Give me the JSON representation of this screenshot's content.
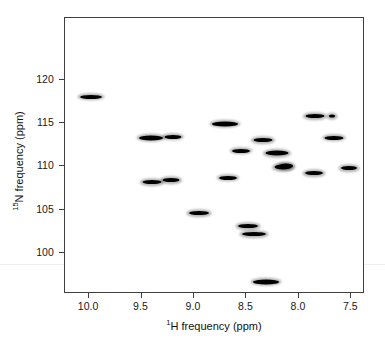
{
  "figure": {
    "kind": "nmr-2d-spectrum",
    "background_color": "#ffffff",
    "frame_color": "#3f3f3f",
    "peak_color": "#000000"
  },
  "axes": {
    "x": {
      "title_prefix": "1",
      "title": "H frequency (ppm)",
      "title_full": "¹H frequency (ppm)",
      "ticks": [
        "10.0",
        "9.5",
        "9.0",
        "8.5",
        "8.0",
        "7.5"
      ],
      "tick_values": [
        10.0,
        9.5,
        9.0,
        8.5,
        8.0,
        7.5
      ],
      "range": [
        10.23,
        7.37
      ],
      "reversed": true
    },
    "y": {
      "title_prefix": "15",
      "title": "N frequency (ppm)",
      "title_full": "¹⁵N frequency (ppm)",
      "ticks": [
        "100",
        "105",
        "110",
        "115",
        "120"
      ],
      "tick_values": [
        100,
        105,
        110,
        115,
        120
      ],
      "range": [
        95.3,
        127.1
      ],
      "reversed": true
    }
  },
  "chart_data": {
    "type": "scatter",
    "title": "",
    "xlabel": "¹H frequency (ppm)",
    "ylabel": "¹⁵N frequency (ppm)",
    "xlim": [
      10.23,
      7.37
    ],
    "ylim": [
      127.1,
      95.3
    ],
    "x_reversed": true,
    "y_reversed": true,
    "grid": false,
    "legend": null,
    "series": [
      {
        "name": "cross peaks",
        "marker": "contour-blob",
        "points": [
          {
            "x": 8.31,
            "y": 96.7,
            "w": 26,
            "h": 5
          },
          {
            "x": 8.43,
            "y": 102.2,
            "w": 24,
            "h": 4
          },
          {
            "x": 8.49,
            "y": 103.1,
            "w": 20,
            "h": 4
          },
          {
            "x": 8.95,
            "y": 104.6,
            "w": 20,
            "h": 4
          },
          {
            "x": 9.4,
            "y": 108.2,
            "w": 19,
            "h": 4
          },
          {
            "x": 9.22,
            "y": 108.4,
            "w": 17,
            "h": 4
          },
          {
            "x": 8.68,
            "y": 108.7,
            "w": 18,
            "h": 4
          },
          {
            "x": 8.15,
            "y": 109.9,
            "w": 17,
            "h": 5
          },
          {
            "x": 8.12,
            "y": 110.0,
            "w": 14,
            "h": 5
          },
          {
            "x": 7.86,
            "y": 109.2,
            "w": 18,
            "h": 4
          },
          {
            "x": 7.52,
            "y": 109.8,
            "w": 16,
            "h": 4
          },
          {
            "x": 8.55,
            "y": 111.8,
            "w": 18,
            "h": 4
          },
          {
            "x": 8.21,
            "y": 111.5,
            "w": 23,
            "h": 5
          },
          {
            "x": 9.41,
            "y": 113.3,
            "w": 24,
            "h": 5
          },
          {
            "x": 9.2,
            "y": 113.4,
            "w": 17,
            "h": 4
          },
          {
            "x": 8.34,
            "y": 113.0,
            "w": 19,
            "h": 4
          },
          {
            "x": 7.67,
            "y": 113.3,
            "w": 19,
            "h": 4
          },
          {
            "x": 8.7,
            "y": 114.9,
            "w": 26,
            "h": 5
          },
          {
            "x": 7.85,
            "y": 115.8,
            "w": 19,
            "h": 4
          },
          {
            "x": 7.68,
            "y": 115.8,
            "w": 6,
            "h": 3
          },
          {
            "x": 9.98,
            "y": 118.0,
            "w": 22,
            "h": 4
          }
        ]
      }
    ]
  }
}
